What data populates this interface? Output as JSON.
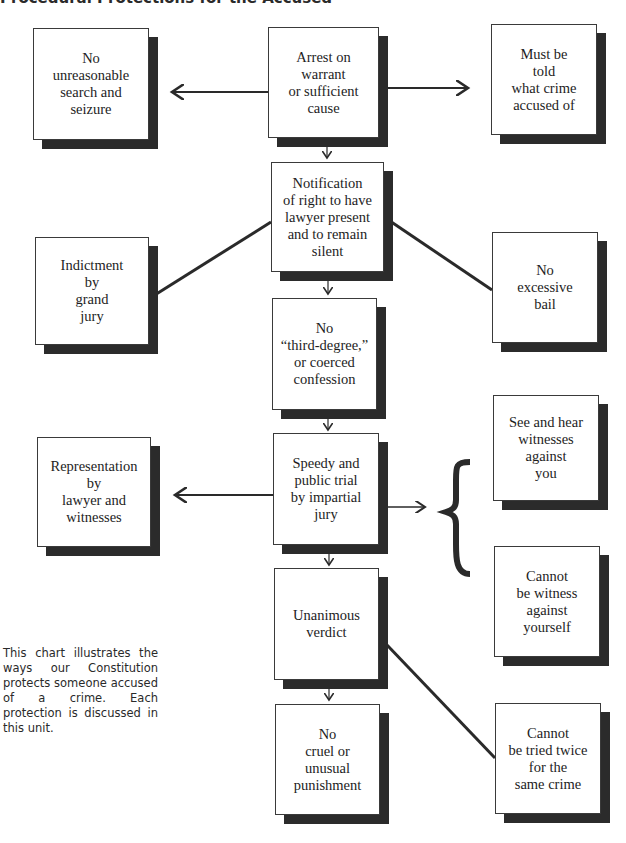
{
  "title": "Procedural Protections for the Accused",
  "caption": "This chart illustrates the ways our Constitution protects someone accused of a crime. Each protection is discussed in this unit.",
  "main_sequence": [
    {
      "id": "arrest",
      "label": "Arrest on\nwarrant\nor sufficient\ncause"
    },
    {
      "id": "notification",
      "label": "Notification\nof right to have\nlawyer present\nand to remain\nsilent"
    },
    {
      "id": "no-coerced-confession",
      "label": "No\n“third-degree,”\nor coerced\nconfession"
    },
    {
      "id": "speedy-trial",
      "label": "Speedy and\npublic trial\nby impartial\njury"
    },
    {
      "id": "unanimous-verdict",
      "label": "Unanimous\nverdict"
    },
    {
      "id": "no-cruel-punishment",
      "label": "No\ncruel or\nunusual\npunishment"
    }
  ],
  "left_protections": [
    {
      "id": "no-unreasonable-search",
      "label": "No\nunreasonable\nsearch and\nseizure",
      "linked_to": "arrest"
    },
    {
      "id": "indictment",
      "label": "Indictment\nby\ngrand\njury",
      "linked_to": "notification"
    },
    {
      "id": "representation",
      "label": "Representation\nby\nlawyer and\nwitnesses",
      "linked_to": "speedy-trial"
    }
  ],
  "right_protections": [
    {
      "id": "told-crime",
      "label": "Must be\ntold\nwhat crime\naccused of",
      "linked_to": "arrest"
    },
    {
      "id": "no-excessive-bail",
      "label": "No\nexcessive\nbail",
      "linked_to": "notification"
    },
    {
      "id": "see-hear-witnesses",
      "label": "See and hear\nwitnesses\nagainst\nyou",
      "linked_to": "speedy-trial"
    },
    {
      "id": "not-witness-against-self",
      "label": "Cannot\nbe witness\nagainst\nyourself",
      "linked_to": "speedy-trial"
    },
    {
      "id": "double-jeopardy",
      "label": "Cannot\nbe tried twice\nfor the\nsame crime",
      "linked_to": "unanimous-verdict"
    }
  ]
}
